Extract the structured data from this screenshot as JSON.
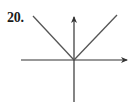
{
  "problem": {
    "number_label": "20."
  },
  "graph": {
    "description": "V-shaped graph with vertex at the origin on a pair of coordinate axes",
    "colors": {
      "axis": "#333333",
      "curve": "#555555",
      "background": "#ffffff"
    },
    "axes": {
      "x_axis": {
        "from": [
          21,
          60
        ],
        "to": [
          128,
          60
        ],
        "arrow": "right"
      },
      "y_axis": {
        "from": [
          74,
          102
        ],
        "to": [
          74,
          16
        ],
        "arrow": "up"
      }
    },
    "vertex": [
      74,
      60
    ],
    "left_arm_end": [
      33,
      16
    ],
    "right_arm_end": [
      117,
      15
    ]
  }
}
